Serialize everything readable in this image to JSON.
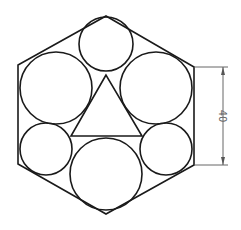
{
  "diagram": {
    "title": "",
    "hexagon": {
      "points": [
        [
          106,
          16
        ],
        [
          194,
          67
        ],
        [
          194,
          165
        ],
        [
          106,
          214
        ],
        [
          18,
          164
        ],
        [
          18,
          65
        ]
      ]
    },
    "circles": [
      {
        "name": "top-small-circle",
        "cx": 106,
        "cy": 44,
        "r": 27
      },
      {
        "name": "upper-left-large-circle",
        "cx": 56,
        "cy": 88,
        "r": 36
      },
      {
        "name": "upper-right-large-circle",
        "cx": 156,
        "cy": 88,
        "r": 36
      },
      {
        "name": "lower-left-small-circle",
        "cx": 46,
        "cy": 149,
        "r": 26
      },
      {
        "name": "lower-right-small-circle",
        "cx": 166,
        "cy": 149,
        "r": 26
      },
      {
        "name": "bottom-large-circle",
        "cx": 106,
        "cy": 174,
        "r": 36
      }
    ],
    "triangle": {
      "points": [
        [
          106,
          75
        ],
        [
          71,
          136
        ],
        [
          142,
          136
        ]
      ]
    },
    "dimension": {
      "label": "40",
      "top_y": 67,
      "bottom_y": 165,
      "line_x": 223,
      "ext_start_x": 194,
      "ext_end_x": 228,
      "color": "#666666"
    }
  }
}
